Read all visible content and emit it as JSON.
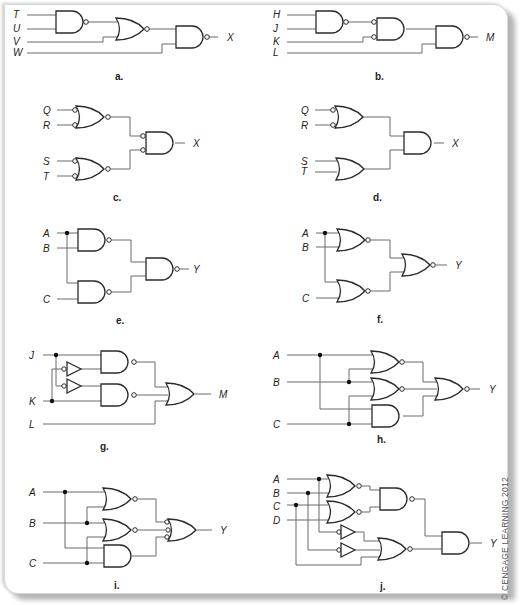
{
  "figure": {
    "copyright": "© CENGAGE LEARNING 2012",
    "panels": {
      "a": {
        "caption": "a.",
        "inputs": [
          "T",
          "U",
          "V",
          "W"
        ],
        "output": "X",
        "gates": [
          "NAND(T,U)",
          "NOR(prev,V)",
          "NAND(prev,W)"
        ]
      },
      "b": {
        "caption": "b.",
        "inputs": [
          "H",
          "J",
          "K",
          "L"
        ],
        "output": "M",
        "gates": [
          "NAND(H,J)",
          "AND with inverted inputs(prev,K)",
          "NAND(prev,L)"
        ]
      },
      "c": {
        "caption": "c.",
        "inputs": [
          "Q",
          "R",
          "S",
          "T"
        ],
        "output": "X",
        "gates": [
          "NOR with inverted inputs(Q,R)",
          "NOR with inverted inputs(S,T)",
          "AND with inverted inputs"
        ]
      },
      "d": {
        "caption": "d.",
        "inputs": [
          "Q",
          "R",
          "S",
          "T"
        ],
        "output": "X",
        "gates": [
          "OR with inverted inputs(Q,R)",
          "OR(S,T)",
          "AND"
        ]
      },
      "e": {
        "caption": "e.",
        "inputs": [
          "A",
          "B",
          "C"
        ],
        "output": "Y",
        "gates": [
          "NAND(A,B)",
          "NAND(A,C)",
          "NAND"
        ]
      },
      "f": {
        "caption": "f.",
        "inputs": [
          "A",
          "B",
          "C"
        ],
        "output": "Y",
        "gates": [
          "NOR(A,B)",
          "NOR(A,C)",
          "NOR"
        ]
      },
      "g": {
        "caption": "g.",
        "inputs": [
          "J",
          "K",
          "L"
        ],
        "output": "M",
        "gates": [
          "NOT(K)",
          "NOT(J)",
          "NAND(J,K')",
          "NAND(J',K)",
          "OR"
        ]
      },
      "h": {
        "caption": "h.",
        "inputs": [
          "A",
          "B",
          "C"
        ],
        "output": "Y",
        "gates": [
          "NOR(A,B)",
          "NOR(B,C)",
          "AND(A,C)",
          "NOR"
        ]
      },
      "i": {
        "caption": "i.",
        "inputs": [
          "A",
          "B",
          "C"
        ],
        "output": "Y",
        "gates": [
          "NOR(A,B)",
          "NOR(B,C)",
          "AND(A,C)",
          "OR with inverted inputs"
        ]
      },
      "j": {
        "caption": "j.",
        "inputs": [
          "A",
          "B",
          "C",
          "D"
        ],
        "output": "Y",
        "gates": [
          "NOR(A,B)",
          "NOR(C,D)",
          "NAND",
          "NOT(A)",
          "NOT(B)",
          "NOR",
          "AND"
        ]
      }
    }
  }
}
